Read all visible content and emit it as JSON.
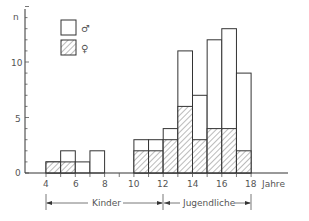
{
  "chart_data": {
    "type": "bar",
    "subtype": "stacked-histogram",
    "title": "",
    "xlabel": "Jahre",
    "ylabel": "n",
    "xlim": [
      4,
      18
    ],
    "ylim": [
      0,
      15
    ],
    "x_ticks": [
      4,
      6,
      8,
      10,
      12,
      14,
      16,
      18
    ],
    "y_ticks": [
      0,
      5,
      10
    ],
    "bins": [
      [
        4,
        5
      ],
      [
        5,
        6
      ],
      [
        6,
        7
      ],
      [
        7,
        8
      ],
      [
        8,
        9
      ],
      [
        9,
        10
      ],
      [
        10,
        11
      ],
      [
        11,
        12
      ],
      [
        12,
        13
      ],
      [
        13,
        14
      ],
      [
        14,
        15
      ],
      [
        15,
        16
      ],
      [
        16,
        17
      ],
      [
        17,
        18
      ]
    ],
    "series": [
      {
        "name": "♂",
        "style": "white",
        "total_values": [
          1,
          2,
          1,
          2,
          0,
          0,
          3,
          3,
          4,
          11,
          7,
          12,
          13,
          9
        ]
      },
      {
        "name": "♀",
        "style": "hatched",
        "values": [
          1,
          1,
          0,
          0,
          0,
          0,
          2,
          2,
          3,
          6,
          3,
          4,
          4,
          2
        ]
      }
    ],
    "male_values": [
      0,
      1,
      1,
      2,
      0,
      0,
      1,
      1,
      1,
      5,
      4,
      8,
      9,
      7
    ],
    "legend": [
      {
        "label": "♂",
        "style": "white"
      },
      {
        "label": "♀",
        "style": "hatched"
      }
    ],
    "legend_position": "top-left",
    "annotations": [
      {
        "text": "Kinder",
        "range": [
          4,
          12
        ]
      },
      {
        "text": "Jugendliche",
        "range": [
          12,
          18
        ]
      }
    ],
    "grid": false
  },
  "labels": {
    "y_axis": "n",
    "x_axis": "Jahre",
    "legend_male": "♂",
    "legend_female": "♀",
    "range_children": "Kinder",
    "range_youth": "Jugendliche",
    "y_tick_0": "0",
    "y_tick_5": "5",
    "y_tick_10": "10",
    "x_tick_4": "4",
    "x_tick_6": "6",
    "x_tick_8": "8",
    "x_tick_10": "10",
    "x_tick_12": "12",
    "x_tick_14": "14",
    "x_tick_16": "16",
    "x_tick_18": "18"
  }
}
